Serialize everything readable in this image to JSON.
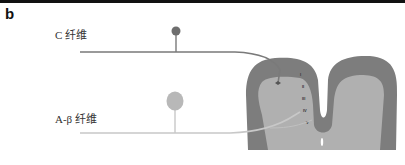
{
  "panel": {
    "label": "b"
  },
  "fibers": {
    "c_fiber": {
      "label": "C 纤维",
      "color": "#7a7a7a",
      "soma_color": "#6e6e6e"
    },
    "a_beta_fiber": {
      "label": "A-β 纤维",
      "color": "#c8c8c8",
      "soma_color": "#b8b8b8"
    }
  },
  "spinal_cord": {
    "white_matter_color": "#7d7d7d",
    "gray_matter_color": "#b0b0b0",
    "laminae": [
      "I",
      "II",
      "III",
      "IV",
      "V"
    ]
  },
  "colors": {
    "top_rule": "#111111",
    "background": "#ffffff"
  }
}
